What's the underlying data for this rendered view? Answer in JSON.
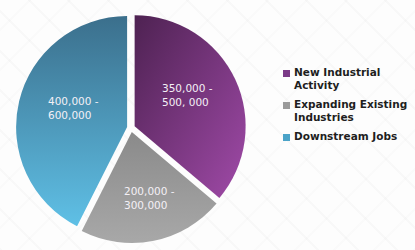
{
  "chart_data": {
    "type": "pie",
    "title": "",
    "slices": [
      {
        "name": "New Industrial Activity",
        "label": "350,000 -\n500, 000",
        "low": 350000,
        "high": 500000,
        "value": 425000,
        "color": "#7a3a86"
      },
      {
        "name": "Expanding Existing Industries",
        "label": "200,000 -\n300,000",
        "low": 200000,
        "high": 300000,
        "value": 250000,
        "color": "#8c8c8c"
      },
      {
        "name": "Downstream Jobs",
        "label": "400,000 -\n600,000",
        "low": 400000,
        "high": 600000,
        "value": 500000,
        "color": "#3f8db0"
      }
    ],
    "legend_position": "right",
    "exploded": true
  },
  "legend": {
    "items": [
      {
        "label": "New Industrial\nActivity",
        "color": "#7b3a87"
      },
      {
        "label": "Expanding Existing\nIndustries",
        "color": "#9a9a9a"
      },
      {
        "label": "Downstream Jobs",
        "color": "#4aa3c8"
      }
    ]
  },
  "slice_labels": [
    {
      "line1": "350,000 -",
      "line2": "500, 000"
    },
    {
      "line1": "200,000 -",
      "line2": "300,000"
    },
    {
      "line1": "400,000 -",
      "line2": "600,000"
    }
  ]
}
